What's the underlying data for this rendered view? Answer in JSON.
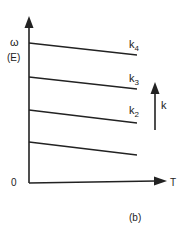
{
  "diagram": {
    "y_axis": {
      "symbol": "ω",
      "unit": "(E)"
    },
    "x_axis": {
      "label": "T",
      "origin": "0"
    },
    "lines": [
      {
        "label": "k",
        "sub": "4"
      },
      {
        "label": "k",
        "sub": "3"
      },
      {
        "label": "k",
        "sub": "2"
      },
      {
        "label": "",
        "sub": ""
      }
    ],
    "direction_arrow": {
      "label": "k"
    },
    "caption": "(b)",
    "stroke_color": "#222222",
    "background": "#ffffff"
  }
}
